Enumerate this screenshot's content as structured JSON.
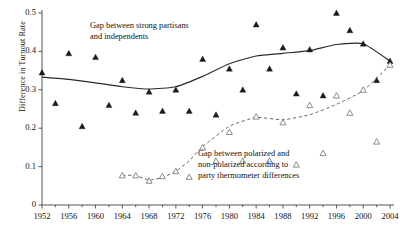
{
  "chart_data": {
    "type": "scatter",
    "title": "",
    "xlabel": "",
    "ylabel": "Difference in Turnout Rate",
    "xlim": [
      1952,
      2004
    ],
    "ylim": [
      0,
      0.5
    ],
    "yticks": [
      "0",
      "0.1",
      "0.2",
      "0.3",
      "0.4",
      "0.5"
    ],
    "ytick_values": [
      0,
      0.1,
      0.2,
      0.3,
      0.4,
      0.5
    ],
    "xticks": [
      "1952",
      "1956",
      "1960",
      "1964",
      "1968",
      "1972",
      "1976",
      "1980",
      "1984",
      "1988",
      "1992",
      "1996",
      "2000",
      "2004"
    ],
    "xtick_values": [
      1952,
      1956,
      1960,
      1964,
      1968,
      1972,
      1976,
      1980,
      1984,
      1988,
      1992,
      1996,
      2000,
      2004
    ],
    "grid": false,
    "legend_position": "none",
    "series": [
      {
        "name": "Gap between strong partisans and independents",
        "marker": "filled-triangle",
        "marker_color": "#1a1a1a",
        "line_style": "solid",
        "line_color": "#2a2a2a",
        "x": [
          1952,
          1954,
          1956,
          1958,
          1960,
          1962,
          1964,
          1966,
          1968,
          1970,
          1972,
          1974,
          1976,
          1978,
          1980,
          1982,
          1984,
          1986,
          1988,
          1990,
          1992,
          1994,
          1996,
          1998,
          2000,
          2002,
          2004
        ],
        "values": [
          0.345,
          0.265,
          0.395,
          0.205,
          0.385,
          0.26,
          0.325,
          0.24,
          0.295,
          0.245,
          0.3,
          0.245,
          0.38,
          0.235,
          0.355,
          0.3,
          0.47,
          0.355,
          0.41,
          0.29,
          0.405,
          0.285,
          0.5,
          0.455,
          0.42,
          0.325,
          0.375
        ],
        "smoothed_line": {
          "x": [
            1952,
            1956,
            1960,
            1964,
            1968,
            1972,
            1976,
            1980,
            1984,
            1988,
            1992,
            1996,
            2000,
            2004
          ],
          "y": [
            0.333,
            0.327,
            0.318,
            0.308,
            0.302,
            0.308,
            0.335,
            0.368,
            0.388,
            0.395,
            0.402,
            0.418,
            0.42,
            0.375
          ]
        }
      },
      {
        "name": "Gap between polarized and non-polarized according to party thermometer differences",
        "marker": "open-triangle",
        "marker_color": "#707070",
        "line_style": "dashed",
        "line_color": "#555555",
        "x": [
          1964,
          1966,
          1968,
          1970,
          1972,
          1974,
          1976,
          1978,
          1980,
          1982,
          1984,
          1986,
          1988,
          1990,
          1992,
          1994,
          1996,
          1998,
          2000,
          2002,
          2004
        ],
        "values": [
          0.077,
          0.077,
          0.063,
          0.075,
          0.088,
          0.073,
          0.15,
          0.115,
          0.19,
          0.115,
          0.23,
          0.115,
          0.215,
          0.105,
          0.26,
          0.135,
          0.285,
          0.24,
          0.3,
          0.165,
          0.365
        ],
        "smoothed_line": {
          "x": [
            1964,
            1966,
            1968,
            1970,
            1972,
            1974,
            1976,
            1980,
            1984,
            1988,
            1992,
            1996,
            2000,
            2004
          ],
          "y": [
            0.077,
            0.077,
            0.065,
            0.072,
            0.088,
            0.115,
            0.152,
            0.205,
            0.228,
            0.222,
            0.235,
            0.262,
            0.298,
            0.365
          ]
        }
      }
    ],
    "annotations": [
      {
        "id": "annot-partisans",
        "lines": [
          "Gap between strong partisans",
          "and independents"
        ]
      },
      {
        "id": "annot-polarized",
        "lines": [
          "Gap between polarized and",
          "non-polarized according to",
          "party thermometer differences"
        ]
      }
    ]
  }
}
